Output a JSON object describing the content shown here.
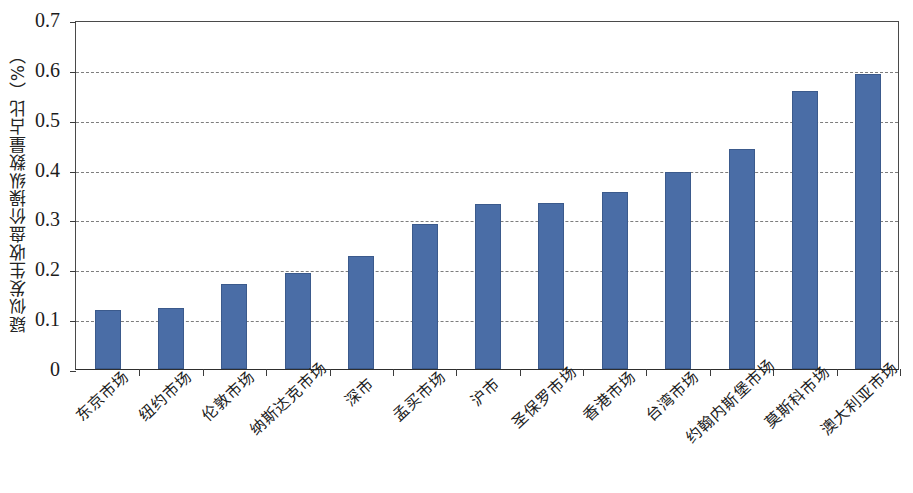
{
  "chart_data": {
    "type": "bar",
    "title": "",
    "xlabel": "",
    "ylabel": "疑似发生收盘价操纵数量占比（%）",
    "ylim": [
      0,
      0.7
    ],
    "ytick_labels": [
      "0.7",
      "0.6",
      "0.5",
      "0.4",
      "0.3",
      "0.2",
      "0.1",
      "0"
    ],
    "ytick_values": [
      0.7,
      0.6,
      0.5,
      0.4,
      0.3,
      0.2,
      0.1,
      0
    ],
    "grid": true,
    "grid_style": "dashed-horizontal",
    "legend": "none",
    "bar_color": "#4a6da6",
    "categories": [
      "东京市场",
      "纽约市场",
      "伦敦市场",
      "纳斯达克市场",
      "深市",
      "孟买市场",
      "沪市",
      "圣保罗市场",
      "香港市场",
      "台湾市场",
      "约翰内斯堡市场",
      "莫斯科市场",
      "澳大利亚市场"
    ],
    "values": [
      0.118,
      0.123,
      0.17,
      0.192,
      0.227,
      0.29,
      0.33,
      0.332,
      0.355,
      0.395,
      0.442,
      0.558,
      0.592
    ]
  }
}
